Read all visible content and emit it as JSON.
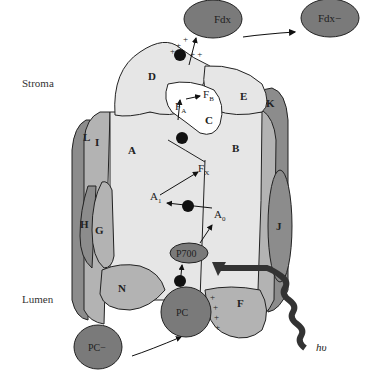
{
  "diagram": {
    "regions": {
      "stroma": "Stroma",
      "lumen": "Lumen"
    },
    "subunits": [
      "A",
      "B",
      "C",
      "D",
      "E",
      "F",
      "G",
      "H",
      "I",
      "J",
      "K",
      "L",
      "N"
    ],
    "cofactors": {
      "p700": "P700",
      "a0": "A",
      "a0_sub": "0",
      "a1": "A",
      "a1_sub": "1",
      "fx": "F",
      "fx_sub": "X",
      "fa": "F",
      "fa_sub": "A",
      "fb": "F",
      "fb_sub": "B"
    },
    "carriers": {
      "fdx": "Fdx",
      "fdx_reduced": "Fdx−",
      "pc": "PC",
      "pc_reduced": "PC−"
    },
    "light": "hυ",
    "electron": "e",
    "electron_charge": "−",
    "colors": {
      "light_protein": "#e6e6e6",
      "mid_protein": "#b3b3b3",
      "dark_protein": "#8c8c8c",
      "carrier": "#7a7a7a",
      "outline": "#222222",
      "white_pocket": "#ffffff"
    }
  }
}
